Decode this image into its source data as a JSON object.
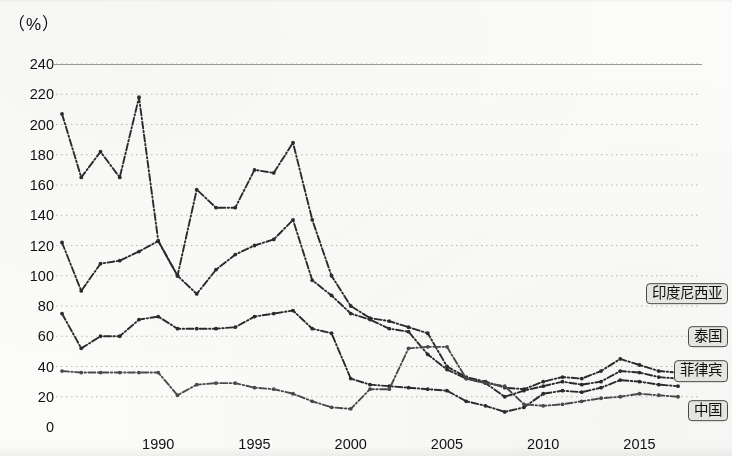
{
  "unit_label": "（%）",
  "legend": [
    {
      "label": "印度尼西亚",
      "key": "indonesia"
    },
    {
      "label": "泰国",
      "key": "thailand"
    },
    {
      "label": "菲律宾",
      "key": "philippines"
    },
    {
      "label": "中国",
      "key": "china"
    }
  ],
  "chart_data": {
    "type": "line",
    "title": "",
    "subtitle": "",
    "xlabel": "",
    "ylabel": "（%）",
    "ylim": [
      0,
      240
    ],
    "xlim": [
      1985,
      2017
    ],
    "ytick_step": 20,
    "yticks": [
      0,
      20,
      40,
      60,
      80,
      100,
      120,
      140,
      160,
      180,
      200,
      220,
      240
    ],
    "xticks": [
      1990,
      1995,
      2000,
      2005,
      2010,
      2015
    ],
    "grid": "horizontal-dotted",
    "legend_position": "right-endpoints",
    "line_style": "dash-dot with round markers",
    "x": [
      1985,
      1986,
      1987,
      1988,
      1989,
      1990,
      1991,
      1992,
      1993,
      1994,
      1995,
      1996,
      1997,
      1998,
      1999,
      2000,
      2001,
      2002,
      2003,
      2004,
      2005,
      2006,
      2007,
      2008,
      2009,
      2010,
      2011,
      2012,
      2013,
      2014,
      2015,
      2016,
      2017
    ],
    "series": [
      {
        "name": "印度尼西亚",
        "color": "#2b2b2b",
        "values": [
          207,
          165,
          182,
          165,
          218,
          123,
          100,
          157,
          145,
          145,
          170,
          168,
          188,
          137,
          100,
          80,
          72,
          70,
          66,
          62,
          40,
          33,
          30,
          26,
          25,
          30,
          33,
          32,
          37,
          45,
          41,
          37,
          36
        ]
      },
      {
        "name": "泰国",
        "color": "#2b2b2b",
        "values": [
          122,
          90,
          108,
          110,
          116,
          123,
          100,
          88,
          104,
          114,
          120,
          124,
          137,
          97,
          87,
          75,
          71,
          65,
          63,
          48,
          38,
          32,
          29,
          20,
          24,
          27,
          30,
          28,
          30,
          37,
          36,
          33,
          32
        ]
      },
      {
        "name": "菲律宾",
        "color": "#2b2b2b",
        "values": [
          75,
          52,
          60,
          60,
          71,
          73,
          65,
          65,
          65,
          66,
          73,
          75,
          77,
          65,
          62,
          32,
          28,
          27,
          26,
          25,
          24,
          17,
          14,
          10,
          13,
          22,
          24,
          23,
          26,
          31,
          30,
          28,
          27
        ]
      },
      {
        "name": "中国",
        "color": "#4a4a4a",
        "values": [
          37,
          36,
          36,
          36,
          36,
          36,
          21,
          28,
          29,
          29,
          26,
          25,
          22,
          17,
          13,
          12,
          25,
          25,
          52,
          53,
          53,
          32,
          29,
          27,
          15,
          14,
          15,
          17,
          19,
          20,
          22,
          21,
          20
        ]
      }
    ]
  }
}
